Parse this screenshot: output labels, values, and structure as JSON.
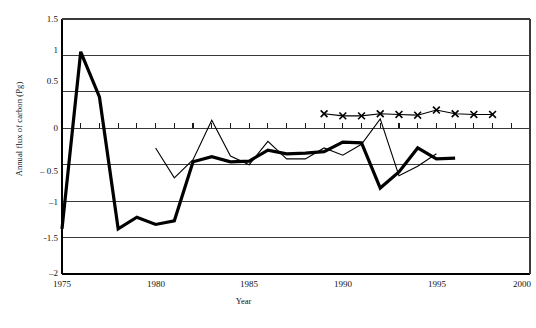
{
  "chart_data": {
    "type": "line",
    "title": "",
    "xlabel": "Year",
    "ylabel": "Annual flux of carbon (Pg)",
    "xlim": [
      1975,
      2000
    ],
    "ylim": [
      -2,
      1.5
    ],
    "yticks": [
      1.5,
      1,
      0.5,
      0,
      -0.5,
      -1,
      -1.5,
      -2
    ],
    "ytick_labels": [
      "1.5",
      "1",
      "0.5",
      "0",
      "– 0.5",
      "–1",
      "-1.5",
      "–2"
    ],
    "xticks": [
      1975,
      1980,
      1985,
      1990,
      1995,
      2000
    ],
    "xtick_labels": [
      "1975",
      "1980",
      "1985",
      "1990",
      "1995",
      "2000"
    ],
    "grid": "horizontal",
    "minor_xticks_on_zero_line": true,
    "legend": "none",
    "series": [
      {
        "name": "thick-line",
        "style": "thick-solid-line",
        "marker": "none",
        "linewidth": 3.2,
        "x": [
          1975,
          1976,
          1977,
          1978,
          1979,
          1980,
          1981,
          1982,
          1983,
          1984,
          1985,
          1986,
          1987,
          1988,
          1989,
          1990,
          1991,
          1992,
          1993,
          1994,
          1995,
          1996
        ],
        "values": [
          -1.38,
          1.05,
          0.43,
          -1.38,
          -1.22,
          -1.32,
          -1.27,
          -0.46,
          -0.39,
          -0.46,
          -0.45,
          -0.3,
          -0.35,
          -0.34,
          -0.32,
          -0.19,
          -0.2,
          -0.82,
          -0.6,
          -0.27,
          -0.42,
          -0.41
        ]
      },
      {
        "name": "thin-line",
        "style": "thin-solid-line",
        "marker": "none",
        "linewidth": 1.1,
        "x": [
          1980,
          1981,
          1982,
          1983,
          1984,
          1985,
          1986,
          1987,
          1988,
          1989,
          1990,
          1991,
          1992,
          1993,
          1994,
          1995
        ],
        "values": [
          -0.27,
          -0.68,
          -0.43,
          0.11,
          -0.38,
          -0.5,
          -0.18,
          -0.42,
          -0.42,
          -0.27,
          -0.37,
          -0.22,
          0.13,
          -0.65,
          -0.52,
          -0.35
        ]
      },
      {
        "name": "x-marker-line",
        "style": "thin-solid-line-with-x-markers",
        "marker": "x",
        "linewidth": 1.1,
        "x": [
          1989,
          1990,
          1991,
          1992,
          1993,
          1994,
          1995,
          1996,
          1997,
          1998
        ],
        "values": [
          0.2,
          0.17,
          0.17,
          0.2,
          0.19,
          0.18,
          0.25,
          0.2,
          0.19,
          0.19
        ]
      }
    ]
  },
  "axis": {
    "ylabel": "Annual flux of carbon (Pg)",
    "xlabel": "Year"
  },
  "caption": {
    "text": ""
  }
}
